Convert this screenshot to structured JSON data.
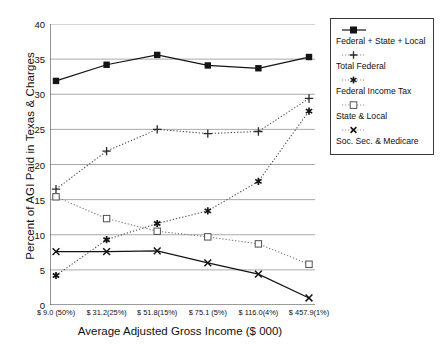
{
  "chart_data": {
    "type": "line",
    "title": "",
    "xlabel": "Average Adjusted Gross Income ($ 000)",
    "ylabel": "Percent of AGI Paid in Texas & Charges",
    "categories": [
      "$ 9.0  (50%)",
      "$ 31.2(25%)",
      "$ 51.8(15%)",
      "$ 75.1 (5%)",
      "$ 116.0(4%)",
      "$ 457.9(1%)"
    ],
    "ylim": [
      0,
      40
    ],
    "yticks": [
      0,
      5,
      10,
      15,
      20,
      25,
      30,
      35,
      40
    ],
    "ytick_labels": [
      "0",
      "5",
      "10",
      "15",
      "20",
      "25",
      "30",
      "35",
      "40"
    ],
    "grid": true,
    "legend_position": "right-outside",
    "series": [
      {
        "name": "Federal + State + Local",
        "marker": "filled-square",
        "linestyle": "solid",
        "color": "#141414",
        "values": [
          31.9,
          34.2,
          35.6,
          34.1,
          33.7,
          35.3
        ]
      },
      {
        "name": "Total Federal",
        "marker": "plus",
        "linestyle": "dotted",
        "color": "#4a4a4a",
        "values": [
          16.5,
          21.9,
          25.0,
          24.4,
          24.7,
          29.4
        ]
      },
      {
        "name": "Federal Income Tax",
        "marker": "asterisk",
        "linestyle": "dotted",
        "color": "#4a4a4a",
        "values": [
          4.2,
          9.3,
          11.6,
          13.4,
          17.6,
          27.6
        ]
      },
      {
        "name": "State & Local",
        "marker": "open-square",
        "linestyle": "dotted",
        "color": "#7a7a7a",
        "values": [
          15.4,
          12.3,
          10.5,
          9.7,
          8.7,
          5.8
        ]
      },
      {
        "name": "Soc. Sec. & Medicare",
        "marker": "cross-x",
        "linestyle": "solid",
        "color": "#141414",
        "values": [
          7.6,
          7.6,
          7.7,
          6.0,
          4.4,
          1.0
        ]
      }
    ]
  },
  "legend": {
    "items": [
      {
        "label": "Federal + State + Local"
      },
      {
        "label": "Total Federal"
      },
      {
        "label": "Federal Income Tax"
      },
      {
        "label": "State & Local"
      },
      {
        "label": "Soc. Sec. & Medicare"
      }
    ]
  },
  "colors": {
    "axis": "#3a3a3a",
    "grid": "#999999",
    "background": "#ffffff",
    "text": "#111111"
  }
}
